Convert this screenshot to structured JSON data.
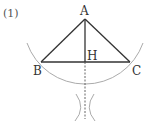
{
  "problem_number": "(1)",
  "points": {
    "A": {
      "label": "A",
      "x": 85,
      "y": 19
    },
    "B": {
      "label": "B",
      "x": 41,
      "y": 62
    },
    "C": {
      "label": "C",
      "x": 130,
      "y": 62
    },
    "H": {
      "label": "H",
      "x": 85,
      "y": 62
    }
  },
  "segments": [
    {
      "from": "A",
      "to": "B",
      "style": "solid"
    },
    {
      "from": "A",
      "to": "C",
      "style": "solid"
    },
    {
      "from": "B",
      "to": "C",
      "style": "solid"
    },
    {
      "from": "A",
      "to": "H",
      "style": "solid"
    },
    {
      "from": "H",
      "to": "below",
      "style": "dashed"
    }
  ],
  "construction": {
    "arc_center": "A",
    "arc_through": [
      "B",
      "C"
    ],
    "intersection_arcs": "two small arcs crossing below H on the perpendicular"
  },
  "colors": {
    "line": "#333333",
    "arc": "#9a9a9a",
    "dashed": "#555555"
  }
}
